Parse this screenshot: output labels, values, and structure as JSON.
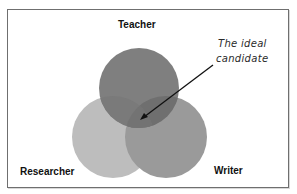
{
  "diagram": {
    "type": "venn",
    "sets": [
      {
        "name": "Teacher",
        "color": "#7d7d7d",
        "cx": 139,
        "cy": 88,
        "r": 40
      },
      {
        "name": "Researcher",
        "color": "#bdbdbd",
        "cx": 113,
        "cy": 137,
        "r": 41
      },
      {
        "name": "Writer",
        "color": "#999999",
        "cx": 166,
        "cy": 137,
        "r": 41
      }
    ],
    "labels": {
      "teacher": "Teacher",
      "researcher": "Researcher",
      "writer": "Writer"
    },
    "annotation": {
      "line1": "The ideal",
      "line2": "candidate",
      "points_to": "intersection of all three sets"
    },
    "colors": {
      "frame_border": "#6f6f6f",
      "background": "#ffffff",
      "arrow": "#111111"
    }
  }
}
